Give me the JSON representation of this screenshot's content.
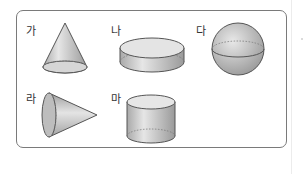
{
  "figure": {
    "type": "solid-shapes-diagram",
    "shapes": [
      {
        "label": "가",
        "shape": "cone-upright"
      },
      {
        "label": "나",
        "shape": "short-cylinder"
      },
      {
        "label": "다",
        "shape": "sphere"
      },
      {
        "label": "라",
        "shape": "cone-sideways"
      },
      {
        "label": "마",
        "shape": "cylinder"
      }
    ]
  },
  "colors": {
    "border": "#7a7a7a",
    "shape_fill": "#c9c9c9",
    "shape_stroke": "#555555"
  }
}
